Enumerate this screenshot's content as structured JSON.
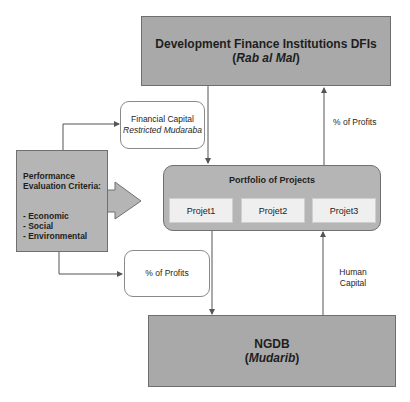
{
  "dfi_box": {
    "title": "Development Finance Institutions DFIs",
    "subtitle_open": "(",
    "subtitle_italic": "Rab al Mal",
    "subtitle_close": ")"
  },
  "ngdb_box": {
    "title": "NGDB",
    "subtitle_open": "(",
    "subtitle_italic": "Mudarib",
    "subtitle_close": ")"
  },
  "criteria_box": {
    "title_line1": "Performance",
    "title_line2": "Evaluation Criteria:",
    "items": [
      "- Economic",
      "- Social",
      "- Environmental"
    ]
  },
  "financial_capital_box": {
    "line1": "Financial Capital",
    "line2": "Restricted Mudaraba"
  },
  "profits_box_lower": {
    "label": "% of Profits"
  },
  "portfolio": {
    "title": "Portfolio of Projects",
    "projects": [
      "Projet1",
      "Projet2",
      "Projet3"
    ]
  },
  "labels": {
    "profits_upper": "% of Profits",
    "human_capital_line1": "Human",
    "human_capital_line2": "Capital"
  },
  "colors": {
    "dark_box": "#a9a9a9",
    "mid_box": "#b5b5b5",
    "project_cell": "#efefef",
    "line": "#555555"
  }
}
